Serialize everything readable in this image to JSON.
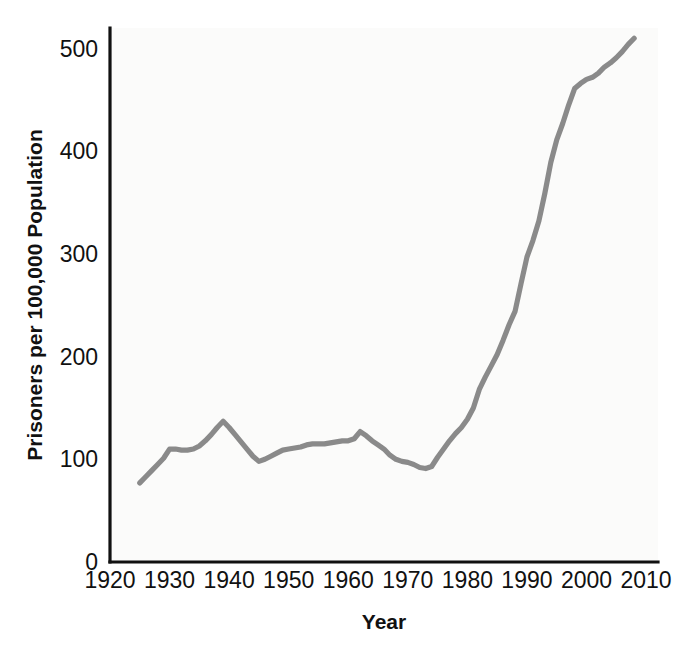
{
  "chart_data": {
    "type": "line",
    "title": "",
    "xlabel": "Year",
    "ylabel": "Prisoners per 100,000 Population",
    "xlim": [
      1920,
      2012
    ],
    "ylim": [
      0,
      520
    ],
    "grid": false,
    "legend": "none",
    "x_ticks": [
      "1920",
      "1930",
      "1940",
      "1950",
      "1960",
      "1970",
      "1980",
      "1990",
      "2000",
      "2010"
    ],
    "y_ticks": [
      "0",
      "100",
      "200",
      "300",
      "400",
      "500"
    ],
    "line_color": "#8a8a8a",
    "axis_color": "#111111",
    "series": [
      {
        "name": "Prisoners per 100,000 Population",
        "x": [
          1925,
          1926,
          1927,
          1928,
          1929,
          1930,
          1931,
          1932,
          1933,
          1934,
          1935,
          1936,
          1937,
          1938,
          1939,
          1940,
          1941,
          1942,
          1943,
          1944,
          1945,
          1946,
          1947,
          1948,
          1949,
          1950,
          1951,
          1952,
          1953,
          1954,
          1955,
          1956,
          1957,
          1958,
          1959,
          1960,
          1961,
          1962,
          1963,
          1964,
          1965,
          1966,
          1967,
          1968,
          1969,
          1970,
          1971,
          1972,
          1973,
          1974,
          1975,
          1976,
          1977,
          1978,
          1979,
          1980,
          1981,
          1982,
          1983,
          1984,
          1985,
          1986,
          1987,
          1988,
          1989,
          1990,
          1991,
          1992,
          1993,
          1994,
          1995,
          1996,
          1997,
          1998,
          1999,
          2000,
          2001,
          2002,
          2003,
          2004,
          2005,
          2006,
          2007,
          2008
        ],
        "values": [
          77,
          83,
          89,
          95,
          101,
          110,
          110,
          109,
          109,
          110,
          113,
          118,
          124,
          131,
          137,
          131,
          124,
          117,
          110,
          103,
          98,
          100,
          103,
          106,
          109,
          110,
          111,
          112,
          114,
          115,
          115,
          115,
          116,
          117,
          118,
          118,
          120,
          127,
          123,
          118,
          114,
          110,
          104,
          100,
          98,
          97,
          95,
          92,
          91,
          93,
          102,
          110,
          118,
          125,
          131,
          139,
          150,
          168,
          180,
          191,
          202,
          216,
          231,
          244,
          271,
          297,
          313,
          332,
          359,
          389,
          411,
          427,
          445,
          461,
          466,
          470,
          472,
          476,
          482,
          486,
          491,
          497,
          504,
          510
        ]
      }
    ],
    "annotations": []
  }
}
